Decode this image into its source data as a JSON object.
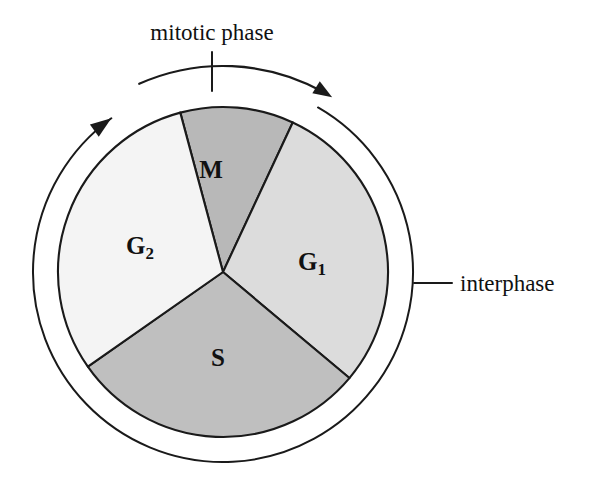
{
  "figure": {
    "title_label": "mitotic phase",
    "side_label": "interphase",
    "background_color": "#ffffff",
    "line_color": "#1a1a1a"
  },
  "chart_data": {
    "type": "pie",
    "title": "mitotic phase",
    "xlabel": "",
    "ylabel": "",
    "legend_position": "none",
    "grid": false,
    "center_x": 223,
    "center_y": 272,
    "radius": 165,
    "outer_ring_radius": 190,
    "categories": [
      "M",
      "G1",
      "S",
      "G2"
    ],
    "values": [
      11,
      29,
      29,
      31
    ],
    "slices": [
      {
        "label": "M",
        "label_display": "M",
        "subscript": "",
        "value": 11,
        "start_angle": -15,
        "end_angle": 25,
        "color": "#b8b8b8",
        "label_x": 211,
        "label_y": 172
      },
      {
        "label": "G1",
        "label_display": "G",
        "subscript": "1",
        "value": 29,
        "start_angle": 25,
        "end_angle": 130,
        "color": "#dcdcdc",
        "label_x": 312,
        "label_y": 264
      },
      {
        "label": "S",
        "label_display": "S",
        "subscript": "",
        "value": 29,
        "start_angle": 130,
        "end_angle": 235,
        "color": "#bfbfbf",
        "label_x": 218,
        "label_y": 360
      },
      {
        "label": "G2",
        "label_display": "G",
        "subscript": "2",
        "value": 31,
        "start_angle": 235,
        "end_angle": 345,
        "color": "#f4f4f4",
        "label_x": 140,
        "label_y": 248
      }
    ],
    "annotations": [
      {
        "name": "mitotic-phase",
        "text": "mitotic phase",
        "text_x": 212,
        "text_y": 40,
        "describes": "M",
        "arrow": "clockwise-arc-over-M"
      },
      {
        "name": "interphase",
        "text": "interphase",
        "text_x": 490,
        "text_y": 289,
        "describes": "G1, S, G2",
        "arrow": "leader-line-to-outer-ring"
      }
    ]
  }
}
